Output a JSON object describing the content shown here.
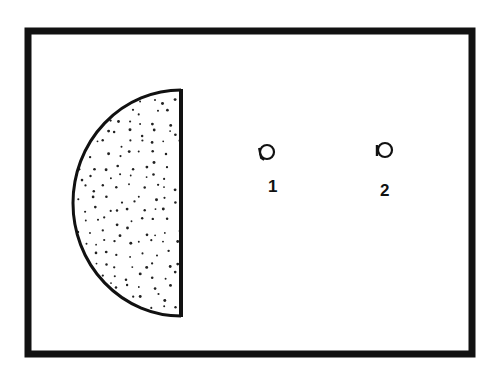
{
  "diagram": {
    "colors": {
      "background": "#ffffff",
      "stroke": "#111111",
      "stipple": "#222222"
    },
    "frame": {
      "x": 28,
      "y": 31,
      "width": 444,
      "height": 323,
      "stroke_width": 7
    },
    "half_disk": {
      "flat_edge_x": 181,
      "center_y": 203,
      "radius_x": 108,
      "radius_y": 113,
      "fill_pattern": "stippled-dots"
    },
    "markers": [
      {
        "id": "1",
        "label": "1",
        "cx": 267,
        "cy": 152,
        "r": 7
      },
      {
        "id": "2",
        "label": "2",
        "cx": 384,
        "cy": 150,
        "r": 7
      }
    ]
  }
}
